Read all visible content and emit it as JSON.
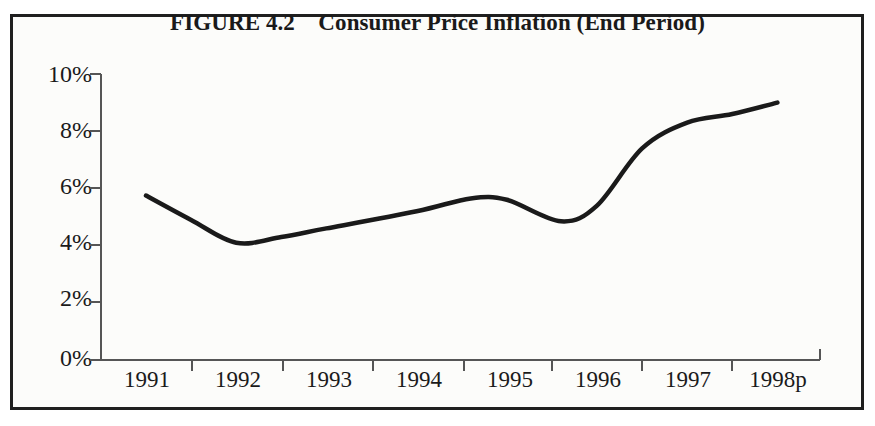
{
  "figure": {
    "title": "FIGURE 4.2    Consumer Price Inflation (End Period)",
    "border_color": "#1f1f1f",
    "background_color": "#fcfcfa",
    "line_color": "#1a1a1a",
    "axis_color": "#555555"
  },
  "chart_data": {
    "type": "line",
    "title": "FIGURE 4.2    Consumer Price Inflation (End Period)",
    "xlabel": "",
    "ylabel": "",
    "categories": [
      "1991",
      "1992",
      "1993",
      "1994",
      "1995",
      "1996",
      "1997",
      "1998p"
    ],
    "x_tick_labels": [
      "1991",
      "1992",
      "1993",
      "1994",
      "1995",
      "1996",
      "1997",
      "1998p"
    ],
    "y_tick_labels": [
      "0%",
      "2%",
      "4%",
      "6%",
      "8%",
      "10%"
    ],
    "y_tick_values": [
      0,
      2,
      4,
      6,
      8,
      10
    ],
    "ylim": [
      0,
      10
    ],
    "grid": false,
    "legend": false,
    "series": [
      {
        "name": "Consumer Price Inflation (End Period)",
        "units": "percent",
        "values": [
          5.75,
          4.1,
          4.6,
          5.2,
          5.65,
          4.85,
          8.3,
          9.0
        ]
      }
    ],
    "curve_points_percent": [
      {
        "x": "1991",
        "y": 5.75
      },
      {
        "x": "1991.5",
        "y": 4.9
      },
      {
        "x": "1992",
        "y": 4.1
      },
      {
        "x": "1992.5",
        "y": 4.3
      },
      {
        "x": "1993",
        "y": 4.6
      },
      {
        "x": "1994",
        "y": 5.2
      },
      {
        "x": "1994.6",
        "y": 5.65
      },
      {
        "x": "1995",
        "y": 5.6
      },
      {
        "x": "1995.6",
        "y": 4.85
      },
      {
        "x": "1996",
        "y": 5.4
      },
      {
        "x": "1996.5",
        "y": 7.4
      },
      {
        "x": "1997",
        "y": 8.3
      },
      {
        "x": "1997.5",
        "y": 8.6
      },
      {
        "x": "1998p",
        "y": 9.0
      }
    ]
  },
  "axes": {
    "y_ticks": [
      {
        "label": "10%",
        "value": 10
      },
      {
        "label": "8%",
        "value": 8
      },
      {
        "label": "6%",
        "value": 6
      },
      {
        "label": "4%",
        "value": 4
      },
      {
        "label": "2%",
        "value": 2
      },
      {
        "label": "0%",
        "value": 0
      }
    ],
    "x_ticks": [
      {
        "label": "1991"
      },
      {
        "label": "1992"
      },
      {
        "label": "1993"
      },
      {
        "label": "1994"
      },
      {
        "label": "1995"
      },
      {
        "label": "1996"
      },
      {
        "label": "1997"
      },
      {
        "label": "1998p"
      }
    ]
  }
}
